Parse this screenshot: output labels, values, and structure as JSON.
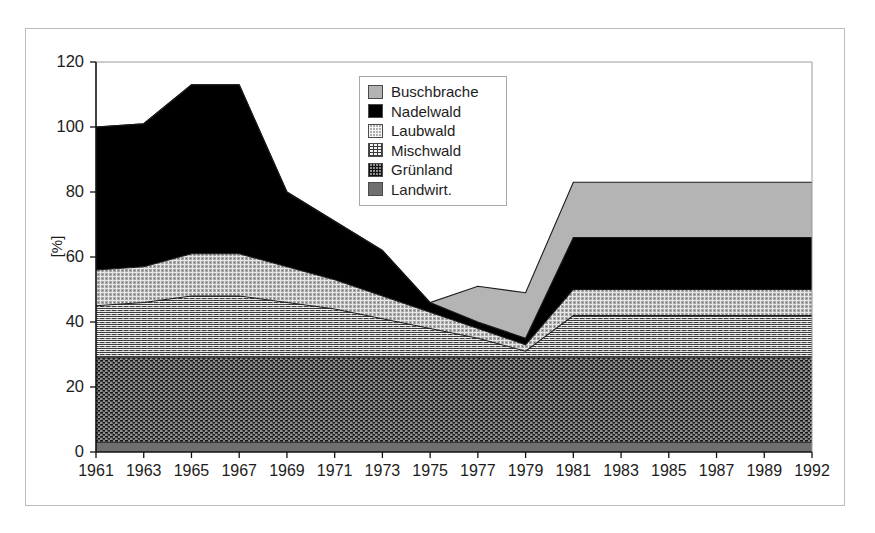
{
  "chart_data": {
    "type": "area",
    "stacked": true,
    "title": "",
    "xlabel": "",
    "ylabel": "[%]",
    "ylim": [
      0,
      120
    ],
    "ytick_values": [
      0,
      20,
      40,
      60,
      80,
      100,
      120
    ],
    "ytick_labels": [
      "0",
      "20",
      "40",
      "60",
      "80",
      "100",
      "120"
    ],
    "grid": false,
    "legend_position": "upper-center",
    "categories": [
      "1961",
      "1963",
      "1965",
      "1967",
      "1969",
      "1971",
      "1973",
      "1975",
      "1977",
      "1979",
      "1981",
      "1983",
      "1985",
      "1987",
      "1989",
      "1992"
    ],
    "stack_order_bottom_to_top": [
      "Landwirt.",
      "Grünland",
      "Mischwald",
      "Laubwald",
      "Nadelwald",
      "Buschbrache"
    ],
    "series": [
      {
        "name": "Landwirt.",
        "color": "#6f6f6f",
        "pattern": "solid-gray",
        "values": [
          3,
          3,
          3,
          3,
          3,
          3,
          3,
          3,
          3,
          3,
          3,
          3,
          3,
          3,
          3,
          3
        ]
      },
      {
        "name": "Grünland",
        "color": "#8f8f8f",
        "pattern": "dark-dots",
        "values": [
          26,
          26,
          26,
          26,
          26,
          26,
          26,
          26,
          26,
          26,
          26,
          26,
          26,
          26,
          26,
          26
        ]
      },
      {
        "name": "Mischwald",
        "color": "#f2f2f2",
        "pattern": "light-crosshatch",
        "values": [
          16,
          17,
          19,
          19,
          17,
          15,
          12,
          9,
          6,
          2,
          13,
          13,
          13,
          13,
          13,
          13
        ]
      },
      {
        "name": "Laubwald",
        "color": "#b0b0b0",
        "pattern": "gray-crosshatch",
        "values": [
          11,
          11,
          13,
          13,
          11,
          9,
          7,
          5,
          3,
          2,
          8,
          8,
          8,
          8,
          8,
          8
        ]
      },
      {
        "name": "Nadelwald",
        "color": "#000000",
        "pattern": "solid-black",
        "values": [
          44,
          44,
          52,
          52,
          23,
          18,
          14,
          3,
          2,
          2,
          16,
          16,
          16,
          16,
          16,
          16
        ]
      },
      {
        "name": "Buschbrache",
        "color": "#b3b3b3",
        "pattern": "solid-light-gray",
        "values": [
          0,
          0,
          0,
          0,
          0,
          0,
          0,
          0,
          11,
          14,
          17,
          17,
          17,
          17,
          17,
          17
        ]
      }
    ],
    "cumulative_tops": {
      "Landwirt.": [
        3,
        3,
        3,
        3,
        3,
        3,
        3,
        3,
        3,
        3,
        3,
        3,
        3,
        3,
        3,
        3
      ],
      "Grünland": [
        29,
        29,
        29,
        29,
        29,
        29,
        29,
        29,
        29,
        29,
        29,
        29,
        29,
        29,
        29,
        29
      ],
      "Mischwald": [
        45,
        46,
        48,
        48,
        46,
        44,
        41,
        38,
        35,
        31,
        42,
        42,
        42,
        42,
        42,
        42
      ],
      "Laubwald": [
        56,
        57,
        61,
        61,
        57,
        53,
        48,
        43,
        38,
        33,
        50,
        50,
        50,
        50,
        50,
        50
      ],
      "Nadelwald": [
        100,
        101,
        113,
        113,
        80,
        71,
        62,
        46,
        40,
        35,
        66,
        66,
        66,
        66,
        66,
        66
      ],
      "Buschbrache": [
        100,
        101,
        113,
        113,
        80,
        71,
        62,
        46,
        51,
        49,
        83,
        83,
        83,
        83,
        83,
        83
      ]
    }
  },
  "legend": {
    "items": [
      {
        "label": "Buschbrache",
        "swatch": "sw-buschbrache"
      },
      {
        "label": "Nadelwald",
        "swatch": "sw-nadelwald"
      },
      {
        "label": "Laubwald",
        "swatch": "sw-laubwald"
      },
      {
        "label": "Mischwald",
        "swatch": "sw-mischwald"
      },
      {
        "label": "Grünland",
        "swatch": "sw-gruenland"
      },
      {
        "label": "Landwirt.",
        "swatch": "sw-landwirt"
      }
    ]
  },
  "axis": {
    "y_title": "[%]"
  },
  "colors": {
    "frame": "#bcbcbc",
    "axis": "#111111",
    "text": "#1d1d1d"
  }
}
